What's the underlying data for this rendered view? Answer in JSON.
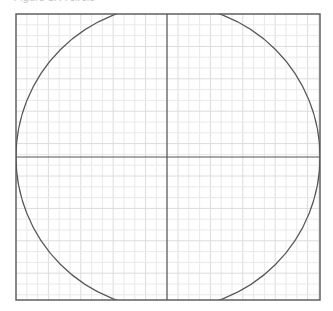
{
  "caption": "Figure 1: A circle",
  "diagram": {
    "type": "circle-on-grid",
    "frame": {
      "x": 16,
      "y": 14,
      "width": 304,
      "height": 286,
      "stroke": "#555555"
    },
    "grid": {
      "spacing": 10.8,
      "minor_color": "#e9e9e9",
      "major_color": "#dcdcdc",
      "major_every": 3
    },
    "axes": {
      "vertical_x": 167,
      "horizontal_y": 157,
      "stroke": "#555555"
    },
    "circle": {
      "cx": 168,
      "cy": 157,
      "r": 152,
      "stroke": "#555555"
    }
  }
}
